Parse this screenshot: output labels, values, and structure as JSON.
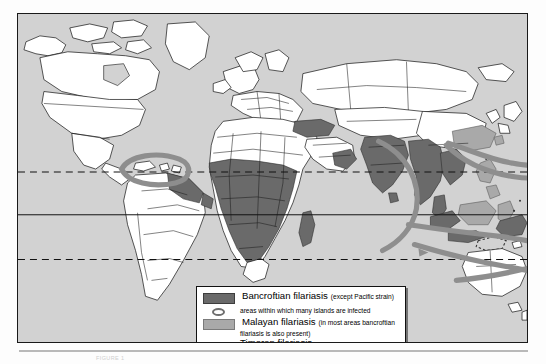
{
  "map": {
    "title": "World distribution of lymphatic filariasis",
    "ocean_color": "#d2d2d2",
    "land_color": "#ffffff",
    "border_color": "#1a1a1a",
    "bancroftian_color": "#6a6a6a",
    "malayan_color": "#a9a9a9",
    "island_band_color": "#8e8e8e",
    "graticule": {
      "equator_label": "Equator",
      "tropic_cancer_label": "Tropic of Cancer",
      "tropic_capricorn_label": "Tropic of Capricorn"
    },
    "regions_bancroftian": [
      "West Africa",
      "Central Africa",
      "East Africa",
      "Madagascar",
      "Turkey",
      "Arabian Peninsula coast",
      "India",
      "Sri Lanka",
      "Bangladesh",
      "Myanmar",
      "Thailand",
      "Indochina",
      "Indonesia",
      "New Guinea",
      "northern South America",
      "Caribbean"
    ],
    "regions_malayan": [
      "southern China",
      "Taiwan",
      "Korea coast",
      "Philippines",
      "Malaysia",
      "Borneo",
      "Sulawesi"
    ],
    "island_corridors": [
      "Caribbean island arc",
      "Indian Ocean to western Pacific",
      "South Pacific island chain"
    ],
    "timoran_region": "Timor and Lesser Sunda Islands"
  },
  "legend": {
    "items": [
      {
        "key": "bancroftian",
        "swatch": "dark-gray-block",
        "label": "Bancroftian filariasis",
        "note": "(except Pacific strain)"
      },
      {
        "key": "islands",
        "swatch": "gray-oval-outline",
        "label": "areas within which many islands are infected",
        "note": ""
      },
      {
        "key": "malayan",
        "swatch": "light-gray-block",
        "label": "Malayan filariasis",
        "note": "(in most areas bancroftian",
        "note_cont": "filariasis is also present)"
      },
      {
        "key": "timoran",
        "swatch": "dotted-outline",
        "label": "Timoran filariasis",
        "note": ""
      }
    ]
  },
  "caption": {
    "text": "FIGURE 1"
  }
}
